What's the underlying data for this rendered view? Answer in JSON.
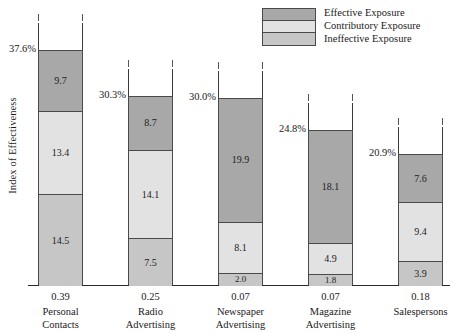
{
  "chart_data": {
    "type": "bar",
    "subtype": "stacked-bar",
    "title": "",
    "xlabel": "",
    "ylabel": "Index of Effectiveness",
    "ylim": [
      0,
      37.6
    ],
    "grid": false,
    "legend_position": "top-right",
    "categories": [
      "Personal Contacts",
      "Radio Advertising",
      "Newspaper Advertising",
      "Magazine Advertising",
      "Salespersons"
    ],
    "series": [
      {
        "name": "Effective Exposure",
        "values": [
          9.7,
          8.7,
          19.9,
          18.1,
          7.6
        ]
      },
      {
        "name": "Contributory Exposure",
        "values": [
          13.4,
          14.1,
          8.1,
          4.9,
          9.4
        ]
      },
      {
        "name": "Ineffective Exposure",
        "values": [
          14.5,
          7.5,
          2.0,
          1.8,
          3.9
        ]
      }
    ],
    "totals_pct": [
      "37.6%",
      "30.3%",
      "30.0%",
      "24.8%",
      "20.9%"
    ],
    "below_values": [
      "0.39",
      "0.25",
      "0.07",
      "0.07",
      "0.18"
    ],
    "colors": {
      "effective": "#a8a8a8",
      "contributory": "#e2e2e2",
      "ineffective": "#c6c6c6",
      "outline": "#4a4a4a",
      "axis": "#2a2a2a"
    }
  },
  "axis": {
    "y_title": "Index of Effectiveness"
  },
  "legend": {
    "items": [
      {
        "label": "Effective Exposure",
        "swatch": "effective"
      },
      {
        "label": "Contributory Exposure",
        "swatch": "contributory"
      },
      {
        "label": "Ineffective Exposure",
        "swatch": "ineffective"
      }
    ]
  },
  "bars": [
    {
      "category_line1": "Personal",
      "category_line2": "Contacts",
      "total_pct": "37.6%",
      "below_value": "0.39",
      "effective": "9.7",
      "contributory": "13.4",
      "ineffective": "14.5"
    },
    {
      "category_line1": "Radio",
      "category_line2": "Advertising",
      "total_pct": "30.3%",
      "below_value": "0.25",
      "effective": "8.7",
      "contributory": "14.1",
      "ineffective": "7.5"
    },
    {
      "category_line1": "Newspaper",
      "category_line2": "Advertising",
      "total_pct": "30.0%",
      "below_value": "0.07",
      "effective": "19.9",
      "contributory": "8.1",
      "ineffective": "2.0"
    },
    {
      "category_line1": "Magazine",
      "category_line2": "Advertising",
      "total_pct": "24.8%",
      "below_value": "0.07",
      "effective": "18.1",
      "contributory": "4.9",
      "ineffective": "1.8"
    },
    {
      "category_line1": "Salespersons",
      "category_line2": "",
      "total_pct": "20.9%",
      "below_value": "0.18",
      "effective": "7.6",
      "contributory": "9.4",
      "ineffective": "3.9"
    }
  ]
}
